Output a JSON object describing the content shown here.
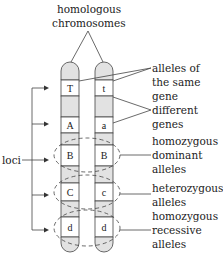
{
  "title": {
    "line1": "homologous",
    "line2": "chromosomes"
  },
  "chromosomes": [
    {
      "name": "left",
      "alleles": [
        "T",
        "A",
        "B",
        "C",
        "d"
      ]
    },
    {
      "name": "right",
      "alleles": [
        "t",
        "a",
        "B",
        "c",
        "d"
      ]
    }
  ],
  "labels": {
    "same_gene": [
      "alleles of",
      "the same",
      "gene"
    ],
    "different_genes": [
      "different",
      "genes"
    ],
    "homozygous_dominant": [
      "homozygous",
      "dominant",
      "alleles"
    ],
    "heterozygous": [
      "heterozygous",
      "alleles"
    ],
    "homozygous_recessive": [
      "homozygous",
      "recessive",
      "alleles"
    ],
    "loci": "loci"
  },
  "colors": {
    "outline": "#444444",
    "shaded_band": "#e2e2e2",
    "text": "#222222"
  }
}
